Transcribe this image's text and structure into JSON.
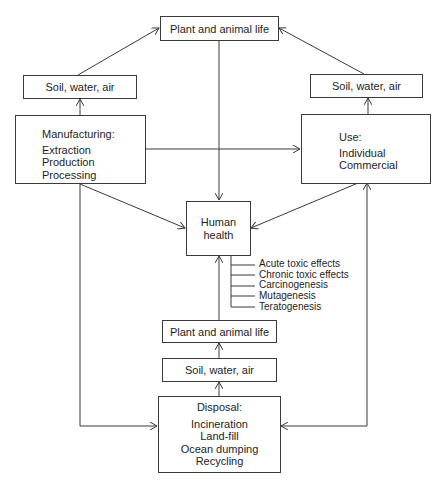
{
  "diagram": {
    "top_plant": "Plant and animal life",
    "soil_left": "Soil, water, air",
    "soil_right": "Soil, water, air",
    "manufacturing": {
      "title": "Manufacturing:",
      "items": [
        "Extraction",
        "Production",
        "Processing"
      ]
    },
    "use": {
      "title": "Use:",
      "items": [
        "Individual",
        "Commercial"
      ]
    },
    "human_health": {
      "line1": "Human",
      "line2": "health"
    },
    "effects": [
      "Acute toxic effects",
      "Chronic toxic effects",
      "Carcinogenesis",
      "Mutagenesis",
      "Teratogenesis"
    ],
    "bottom_plant": "Plant and animal life",
    "soil_bottom": "Soil, water, air",
    "disposal": {
      "title": "Disposal:",
      "items": [
        "Incineration",
        "Land-fill",
        "Ocean dumping",
        "Recycling"
      ]
    }
  }
}
